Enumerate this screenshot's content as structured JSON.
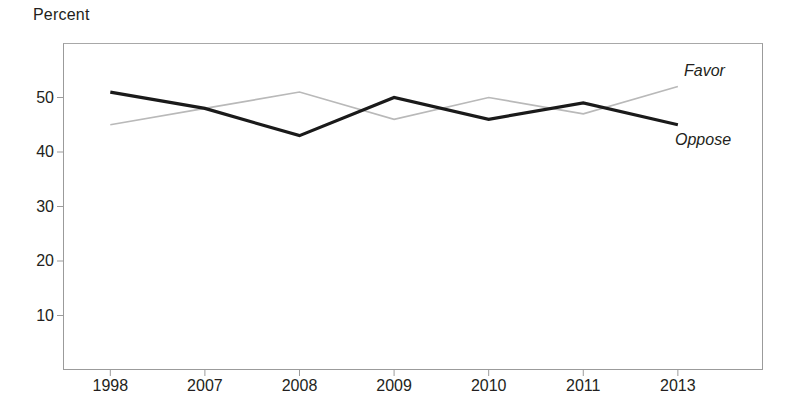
{
  "chart_data": {
    "type": "line",
    "title": "",
    "ylabel": "Percent",
    "xlabel": "",
    "categories": [
      "1998",
      "2007",
      "2008",
      "2009",
      "2010",
      "2011",
      "2013"
    ],
    "series": [
      {
        "name": "Favor",
        "color": "#b9b9b9",
        "values": [
          45,
          48,
          51,
          46,
          50,
          47,
          52
        ]
      },
      {
        "name": "Oppose",
        "color": "#1a1a1a",
        "values": [
          51,
          48,
          43,
          50,
          46,
          49,
          45
        ]
      }
    ],
    "ylim": [
      0,
      60
    ],
    "yticks": [
      10,
      20,
      30,
      40,
      50
    ],
    "ytick_labels": [
      "10",
      "20",
      "30",
      "40",
      "50"
    ],
    "grid": false,
    "legend_position": "inline-right-end",
    "annotations": [
      {
        "text": "Favor",
        "series": "Favor",
        "style": "italic"
      },
      {
        "text": "Oppose",
        "series": "Oppose",
        "style": "italic"
      }
    ]
  }
}
